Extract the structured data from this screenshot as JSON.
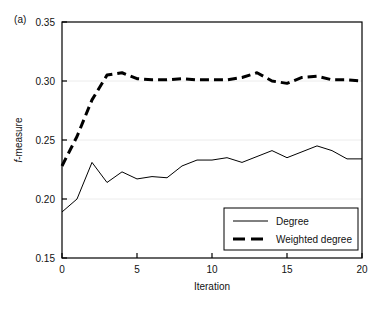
{
  "figure": {
    "panel_label": "(a)",
    "background": "#ffffff",
    "width": 390,
    "height": 310
  },
  "chart_data": {
    "type": "line",
    "title": "",
    "subtitle": "",
    "xlabel": "Iteration",
    "ylabel": "f-measure",
    "ylabel_prefix_italic": "f",
    "ylabel_suffix": "-measure",
    "xlim": [
      0,
      20
    ],
    "ylim": [
      0.15,
      0.35
    ],
    "xticks": [
      0,
      5,
      10,
      15,
      20
    ],
    "xtick_labels": [
      "0",
      "5",
      "10",
      "15",
      "20"
    ],
    "yticks": [
      0.15,
      0.2,
      0.25,
      0.3,
      0.35
    ],
    "ytick_labels": [
      "0.15",
      "0.20",
      "0.25",
      "0.30",
      "0.35"
    ],
    "grid": true,
    "grid_axis": "y",
    "grid_color": "#ececec",
    "frame": true,
    "frame_color": "#000000",
    "legend_position": "lower right",
    "x": [
      0,
      1,
      2,
      3,
      4,
      5,
      6,
      7,
      8,
      9,
      10,
      11,
      12,
      13,
      14,
      15,
      16,
      17,
      18,
      19,
      20
    ],
    "series": [
      {
        "name": "Degree",
        "style": "solid",
        "color": "#000000",
        "width": 1,
        "values": [
          0.189,
          0.2,
          0.231,
          0.214,
          0.223,
          0.217,
          0.219,
          0.218,
          0.228,
          0.233,
          0.233,
          0.235,
          0.231,
          0.236,
          0.241,
          0.235,
          0.24,
          0.245,
          0.241,
          0.234,
          0.234
        ]
      },
      {
        "name": "Weighted degree",
        "style": "dashed",
        "color": "#000000",
        "width": 3,
        "values": [
          0.228,
          0.253,
          0.284,
          0.305,
          0.307,
          0.302,
          0.301,
          0.301,
          0.302,
          0.301,
          0.301,
          0.301,
          0.303,
          0.307,
          0.3,
          0.298,
          0.303,
          0.304,
          0.301,
          0.301,
          0.3
        ]
      }
    ]
  },
  "legend": {
    "items": [
      {
        "label": "Degree",
        "style": "solid"
      },
      {
        "label": "Weighted degree",
        "style": "dashed"
      }
    ]
  }
}
